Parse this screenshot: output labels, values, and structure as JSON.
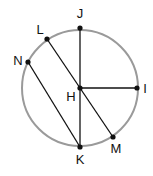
{
  "diagram": {
    "type": "circle-geometry",
    "circle": {
      "center": "H",
      "cx": 80,
      "cy": 88,
      "r": 58,
      "stroke": "#9a9a9a"
    },
    "line_color": "#111111",
    "points": {
      "J": {
        "label": "J",
        "x": 80,
        "y": 28,
        "lx": 80,
        "ly": 18
      },
      "L": {
        "label": "L",
        "x": 47,
        "y": 39,
        "lx": 40,
        "ly": 34
      },
      "N": {
        "label": "N",
        "x": 28,
        "y": 62,
        "lx": 18,
        "ly": 65
      },
      "H": {
        "label": "H",
        "x": 80,
        "y": 88,
        "lx": 71,
        "ly": 101
      },
      "I": {
        "label": "I",
        "x": 137,
        "y": 88,
        "lx": 145,
        "ly": 93
      },
      "K": {
        "label": "K",
        "x": 80,
        "y": 147,
        "lx": 80,
        "ly": 164
      },
      "M": {
        "label": "M",
        "x": 113,
        "y": 137,
        "lx": 116,
        "ly": 153
      }
    },
    "segments": [
      {
        "name": "JK",
        "from": "J",
        "to": "K"
      },
      {
        "name": "HI",
        "from": "H",
        "to": "I"
      },
      {
        "name": "LM",
        "from": "L",
        "to": "M"
      },
      {
        "name": "NK",
        "from": "N",
        "to": "K"
      }
    ]
  }
}
